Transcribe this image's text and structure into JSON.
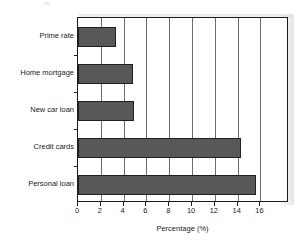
{
  "chart_data": {
    "type": "bar",
    "orientation": "horizontal",
    "title": "",
    "xlabel": "Percentage (%)",
    "ylabel": "",
    "categories": [
      "Prime rate",
      "Home mortgage",
      "New car loan",
      "Credit cards",
      "Personal loan"
    ],
    "values": [
      3.3,
      4.8,
      4.9,
      14.3,
      15.6
    ],
    "xlim": [
      0,
      18.5
    ],
    "xticks": [
      0,
      2,
      4,
      6,
      8,
      10,
      12,
      14,
      16
    ],
    "xtick_labels": [
      "0",
      "2",
      "4",
      "6",
      "8",
      "10",
      "12",
      "14",
      "16"
    ],
    "grid": "vertical",
    "legend": "none",
    "bar_color": "#585858",
    "bar_edge_color": "#202020",
    "gridline_color": "#6e6e6e",
    "axis_color": "#1c1c1c",
    "background": "#ffffff"
  }
}
